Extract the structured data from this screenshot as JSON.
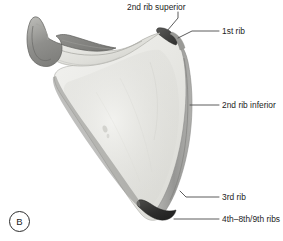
{
  "figure": {
    "panel_letter": "B",
    "background_color": "#ffffff",
    "text_color": "#1d1d1d",
    "leader_line_color": "#4a4a4a"
  },
  "annotations": [
    {
      "id": "2nd-rib-superior",
      "text": "2nd rib superior",
      "label_x": 127,
      "label_y": 2,
      "leader": "from label down-right to superior angle dark marking",
      "target_x": 166,
      "target_y": 32
    },
    {
      "id": "1st-rib",
      "text": "1st rib",
      "label_x": 222,
      "label_y": 26,
      "leader": "horizontal then diagonal to superior-lateral angle",
      "target_x": 177,
      "target_y": 37
    },
    {
      "id": "2nd-rib-inferior",
      "text": "2nd rib inferior",
      "label_x": 222,
      "label_y": 100,
      "leader": "horizontal to medial border shaded band",
      "target_x": 190,
      "target_y": 104
    },
    {
      "id": "3rd-rib",
      "text": "3rd rib",
      "label_x": 222,
      "label_y": 192,
      "leader": "horizontal to lower medial border",
      "target_x": 186,
      "target_y": 197
    },
    {
      "id": "4th-8th-9th-ribs",
      "text": "4th–8th/9th ribs",
      "label_x": 222,
      "label_y": 214,
      "leader": "horizontal to inferior angle dark tip",
      "target_x": 175,
      "target_y": 219
    }
  ],
  "anatomy_parts": [
    {
      "name": "coracoid-process",
      "tone": "dark-gray",
      "color": "#8d8d8b"
    },
    {
      "name": "scapular-neck-glenoid",
      "tone": "light-gray",
      "color": "#d9d9d4"
    },
    {
      "name": "scapular-body-subscapular-fossa",
      "tone": "pale-gray",
      "color": "#e9e9e5"
    },
    {
      "name": "medial-border-band",
      "tone": "mid-gray",
      "color": "#9b9b99"
    },
    {
      "name": "superior-angle-marking",
      "tone": "near-black",
      "color": "#3a3a3a"
    },
    {
      "name": "inferior-angle-tip",
      "tone": "near-black",
      "color": "#2e2e2e"
    },
    {
      "name": "lateral-border",
      "tone": "gray",
      "color": "#7d7d7b"
    }
  ]
}
